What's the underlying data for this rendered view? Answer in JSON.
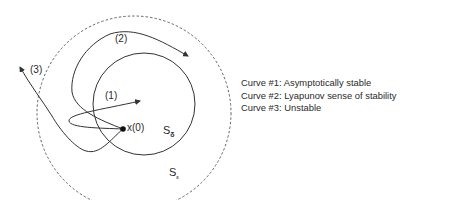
{
  "diagram": {
    "labels": {
      "curve1": "(1)",
      "curve2": "(2)",
      "curve3": "(3)",
      "origin": "x(0)",
      "s_delta": "S",
      "s_delta_sub": "δ",
      "s_eps": "S",
      "s_eps_sub": "ε"
    },
    "legend": [
      "Curve #1: Asymptotically stable",
      "Curve #2: Lyapunov sense of stability",
      "Curve #3: Unstable"
    ],
    "colors": {
      "line": "#333333",
      "dashed": "#555555",
      "text": "#2a2a2a"
    }
  }
}
